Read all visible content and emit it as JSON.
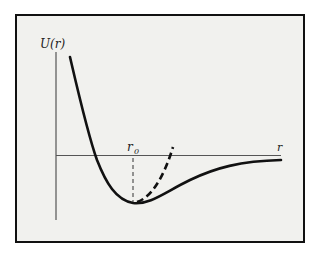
{
  "diagram": {
    "y_axis_label": "U(r)",
    "x_axis_label": "r",
    "equilibrium_label": "r",
    "equilibrium_subscript": "0",
    "curves": [
      {
        "name": "potential",
        "style": "solid"
      },
      {
        "name": "harmonic-approximation",
        "style": "dashed"
      }
    ],
    "colors": {
      "background": "#f1f1ee",
      "line": "#111111",
      "axis": "#555555"
    }
  }
}
